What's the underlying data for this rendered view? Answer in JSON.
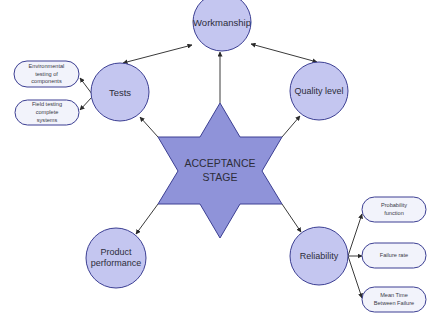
{
  "diagram": {
    "center": {
      "line1": "ACCEPTANCE",
      "line2": "STAGE"
    },
    "nodes": {
      "workmanship": {
        "label": "Workmanship"
      },
      "tests": {
        "label": "Tests"
      },
      "quality_level": {
        "label": "Quality level"
      },
      "product_performance": {
        "line1": "Product",
        "line2": "performance"
      },
      "reliability": {
        "label": "Reliability"
      }
    },
    "tests_children": [
      {
        "line1": "Environmental",
        "line2": "testing of",
        "line3": "components"
      },
      {
        "line1": "Field testing",
        "line2": "complete",
        "line3": "systems"
      }
    ],
    "reliability_children": [
      {
        "line1": "Probability",
        "line2": "function"
      },
      {
        "line1": "Failure rate"
      },
      {
        "line1": "Mean Time",
        "line2": "Between Failure"
      }
    ],
    "colors": {
      "star_fill": "#8f93d9",
      "circle_fill": "#c4c6f0",
      "pill_fill": "#f2f3fb",
      "stroke": "#3c3f93",
      "arrow": "#333333"
    }
  }
}
